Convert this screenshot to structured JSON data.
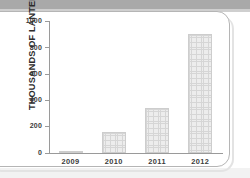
{
  "chart_data": {
    "type": "bar",
    "title": "",
    "subtitle": "",
    "xlabel": "",
    "ylabel": "THOUSANDS OF LANTERNS",
    "categories": [
      "2009",
      "2010",
      "2011",
      "2012"
    ],
    "values": [
      10,
      160,
      340,
      900
    ],
    "series": [
      {
        "name": "Lanterns",
        "values": [
          10,
          160,
          340,
          900
        ]
      }
    ],
    "ylim": [
      0,
      1000
    ],
    "ytick_labels": [
      "1000",
      "800",
      "600",
      "400",
      "200",
      "0"
    ],
    "ytick_values": [
      1000,
      800,
      600,
      400,
      200,
      0
    ],
    "ytick_step": 200,
    "grid": false,
    "legend": false,
    "legend_position": "none",
    "bar_fill_color": "#ededed",
    "bar_edge_color": "#cdcdcd",
    "axis_color": "#9a9a9a",
    "text_color": "#2b2b2b",
    "background_color": "#ffffff"
  },
  "card": {
    "border_color": "#b5b5b5",
    "background_color": "#ffffff"
  },
  "page": {
    "top_band_color": "#a9a9a9"
  }
}
